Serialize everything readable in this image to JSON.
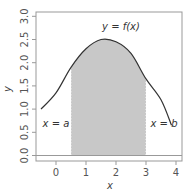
{
  "chart_data": {
    "type": "area",
    "title": "",
    "xlabel": "x",
    "ylabel": "y",
    "xlim": [
      -0.67,
      4.2
    ],
    "ylim": [
      -0.1,
      3.1
    ],
    "xticks": [
      "0",
      "1",
      "2",
      "3",
      "4"
    ],
    "yticks": [
      "0.0",
      "0.5",
      "1.0",
      "1.5",
      "2.0",
      "2.5",
      "3.0"
    ],
    "grid": false,
    "series": [
      {
        "name": "y = f(x)",
        "x": [
          -0.5,
          0,
          0.5,
          1,
          1.5,
          2,
          2.5,
          3,
          3.5,
          3.85
        ],
        "values": [
          1.0,
          1.35,
          1.9,
          2.3,
          2.5,
          2.45,
          2.2,
          1.65,
          1.2,
          0.65
        ]
      }
    ],
    "shaded_region": {
      "from": 0.5,
      "to": 3.0,
      "color": "#c8c8c8"
    },
    "annotations": [
      {
        "text": "y = f(x)",
        "x": 2.1,
        "y": 2.75
      },
      {
        "text": "x = a",
        "x": 0.0,
        "y": 0.7
      },
      {
        "text": "x = b",
        "x": 3.55,
        "y": 0.7
      }
    ]
  },
  "labels": {
    "curve": "y = f(x)",
    "a": "x = a",
    "b": "x = b",
    "xaxis": "x",
    "yaxis": "y"
  },
  "colors": {
    "curve": "#333333",
    "shade": "#c8c8c8",
    "box": "#999999"
  }
}
